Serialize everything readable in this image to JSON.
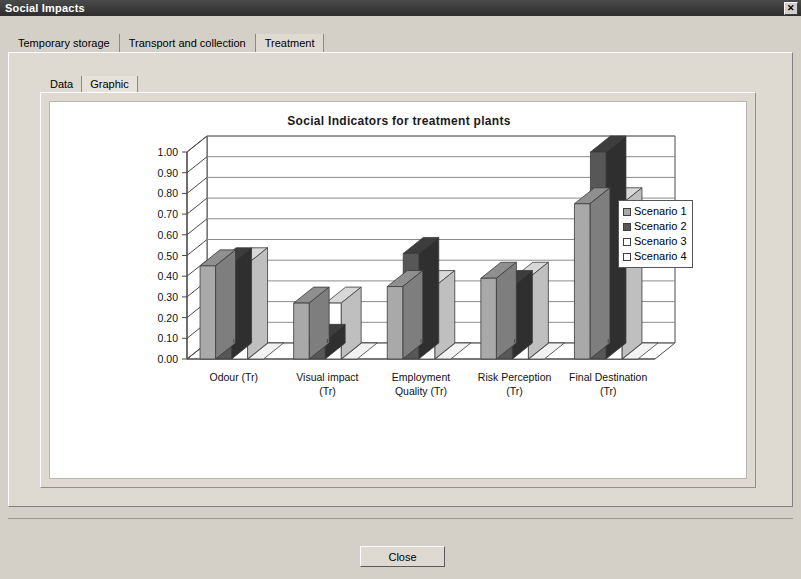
{
  "window": {
    "title": "Social Impacts",
    "close_icon": "close-x-icon",
    "close_icon_glyph": "✕"
  },
  "tabs": {
    "items": [
      {
        "label": "Temporary storage",
        "selected": false
      },
      {
        "label": "Transport and collection",
        "selected": false
      },
      {
        "label": "Treatment",
        "selected": true
      }
    ]
  },
  "inner_tabs": {
    "items": [
      {
        "label": "Data",
        "selected": false
      },
      {
        "label": "Graphic",
        "selected": true
      }
    ]
  },
  "footer": {
    "close_label": "Close"
  },
  "colors": {
    "scenario1": "#a9a9a9",
    "scenario2": "#575757",
    "scenario3": "#ffffff",
    "scenario4": "#ffffff",
    "scenario1_top": "#8f8f8f",
    "scenario2_top": "#3d3d3d",
    "scenario3_top": "#d8d8d8",
    "bar_outline": "#3a3a3a",
    "gridline": "#8c8c8c",
    "axis": "#4a4a4a",
    "titlebar": "#3a3a3a",
    "panel": "#dedad2",
    "canvas": "#ffffff"
  },
  "chart_data": {
    "type": "bar",
    "title": "Social Indicators for treatment plants",
    "xlabel": "",
    "ylabel": "",
    "ylim": [
      0.0,
      1.0
    ],
    "ytick_labels": [
      "1.00",
      "0.90",
      "0.80",
      "0.70",
      "0.60",
      "0.50",
      "0.40",
      "0.30",
      "0.20",
      "0.10",
      "0.00"
    ],
    "yticks": [
      1.0,
      0.9,
      0.8,
      0.7,
      0.6,
      0.5,
      0.4,
      0.3,
      0.2,
      0.1,
      0.0
    ],
    "grid": true,
    "legend_position": "right",
    "three_d": true,
    "categories": [
      "Odour (Tr)",
      "Visual impact (Tr)",
      "Employment Quality (Tr)",
      "Risk Perception (Tr)",
      "Final Destination (Tr)"
    ],
    "category_lines": [
      [
        "Odour (Tr)"
      ],
      [
        "Visual impact",
        "(Tr)"
      ],
      [
        "Employment",
        "Quality (Tr)"
      ],
      [
        "Risk Perception",
        "(Tr)"
      ],
      [
        "Final Destination",
        "(Tr)"
      ]
    ],
    "series": [
      {
        "name": "Scenario 1",
        "color": "#a9a9a9",
        "values": [
          0.45,
          0.27,
          0.35,
          0.39,
          0.75
        ]
      },
      {
        "name": "Scenario 2",
        "color": "#575757",
        "values": [
          0.46,
          0.09,
          0.51,
          0.35,
          1.0
        ]
      },
      {
        "name": "Scenario 3",
        "color": "#ffffff",
        "values": [
          0.46,
          0.27,
          0.35,
          0.39,
          0.75
        ]
      },
      {
        "name": "Scenario 4",
        "color": "#ffffff",
        "values": [
          0.0,
          0.0,
          0.0,
          0.0,
          0.0
        ]
      }
    ]
  }
}
